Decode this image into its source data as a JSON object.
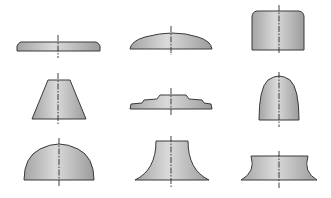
{
  "diagram": {
    "type": "axisymmetric-profile-shapes",
    "layout": {
      "rows": 3,
      "columns": 3
    },
    "style": {
      "fill_light": "#d6d6d6",
      "fill_dark": "#9a9a9a",
      "stroke": "#3a3a3a",
      "centerline": "#2a2a2a",
      "background": "#ffffff"
    },
    "shapes": [
      {
        "row": 1,
        "col": 1,
        "name": "thin-flat-plate"
      },
      {
        "row": 1,
        "col": 2,
        "name": "shallow-dome"
      },
      {
        "row": 1,
        "col": 3,
        "name": "rounded-top-cylinder"
      },
      {
        "row": 2,
        "col": 1,
        "name": "truncated-cone"
      },
      {
        "row": 2,
        "col": 2,
        "name": "stepped-plate"
      },
      {
        "row": 2,
        "col": 3,
        "name": "paraboloid"
      },
      {
        "row": 3,
        "col": 1,
        "name": "hemisphere"
      },
      {
        "row": 3,
        "col": 2,
        "name": "concave-flared-cone"
      },
      {
        "row": 3,
        "col": 3,
        "name": "concave-spool"
      }
    ]
  }
}
